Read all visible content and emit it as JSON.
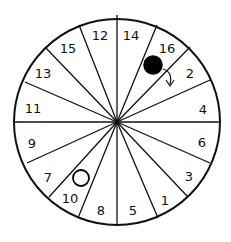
{
  "wheel": {
    "center": [
      117,
      122
    ],
    "radius": 103,
    "spoke_endpoints": [
      [
        117,
        15
      ],
      [
        157,
        25
      ],
      [
        190,
        47
      ],
      [
        210,
        80
      ],
      [
        220,
        122
      ],
      [
        210,
        163
      ],
      [
        188,
        197
      ],
      [
        158,
        218
      ],
      [
        117,
        224
      ],
      [
        78,
        218
      ],
      [
        49,
        197
      ],
      [
        27,
        163
      ],
      [
        15,
        122
      ],
      [
        25,
        82
      ],
      [
        45,
        47
      ],
      [
        79,
        25
      ]
    ],
    "segments": [
      {
        "label": "14",
        "x": 131,
        "y": 40
      },
      {
        "label": "16",
        "x": 167,
        "y": 53
      },
      {
        "label": "2",
        "x": 190,
        "y": 78
      },
      {
        "label": "4",
        "x": 203,
        "y": 114
      },
      {
        "label": "6",
        "x": 202,
        "y": 147
      },
      {
        "label": "3",
        "x": 189,
        "y": 181
      },
      {
        "label": "1",
        "x": 165,
        "y": 205
      },
      {
        "label": "5",
        "x": 133,
        "y": 215
      },
      {
        "label": "8",
        "x": 101,
        "y": 215
      },
      {
        "label": "10",
        "x": 70,
        "y": 203
      },
      {
        "label": "7",
        "x": 48,
        "y": 182
      },
      {
        "label": "9",
        "x": 32,
        "y": 148
      },
      {
        "label": "11",
        "x": 33,
        "y": 113
      },
      {
        "label": "13",
        "x": 43,
        "y": 78
      },
      {
        "label": "15",
        "x": 68,
        "y": 53
      },
      {
        "label": "12",
        "x": 100,
        "y": 40
      }
    ]
  },
  "pieces": {
    "black_ball": {
      "cx": 153,
      "cy": 65,
      "r": 9,
      "color": "#000000"
    },
    "white_ball": {
      "cx": 81,
      "cy": 178,
      "r": 8,
      "color": "#ffffff"
    }
  },
  "move_arrow": {
    "from": "16",
    "to": "2"
  }
}
